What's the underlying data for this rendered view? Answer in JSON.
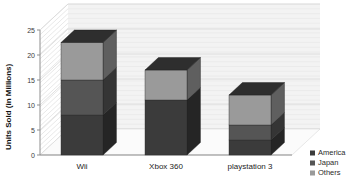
{
  "chart_data": {
    "type": "bar",
    "stacked": true,
    "three_d": true,
    "title": "",
    "xlabel": "",
    "ylabel": "Units Sold (in Millions)",
    "ylim": [
      0,
      25
    ],
    "yticks": [
      0,
      5,
      10,
      15,
      20,
      25
    ],
    "ytick_labels": [
      "0",
      "5",
      "10",
      "15",
      "20",
      "25"
    ],
    "grid": true,
    "categories": [
      "Wii",
      "Xbox 360",
      "playstation 3"
    ],
    "series": [
      {
        "name": "America",
        "color": "#3b3b3b",
        "values": [
          8.0,
          11.0,
          3.0
        ]
      },
      {
        "name": "Japan",
        "color": "#555555",
        "values": [
          7.0,
          0.0,
          3.0
        ]
      },
      {
        "name": "Others",
        "color": "#9a9a9a",
        "values": [
          7.5,
          6.0,
          6.0
        ]
      }
    ],
    "totals": [
      22.5,
      17.0,
      12.0
    ],
    "legend_position": "bottom-right",
    "legend_entries": [
      {
        "label": "America",
        "color": "#3b3b3b"
      },
      {
        "label": "Japan",
        "color": "#555555"
      },
      {
        "label": "Others",
        "color": "#9a9a9a"
      }
    ]
  },
  "colors": {
    "america": "#3b3b3b",
    "japan": "#555555",
    "others": "#9a9a9a",
    "side_america": "#262626",
    "side_japan": "#3a3a3a",
    "side_others": "#6b6b6b",
    "top_face": "#2f2f2f",
    "axis": "#8d8d8d",
    "grid": "#d8d8d8",
    "wall": "#f3f3f3",
    "floor": "#fbfbfb",
    "text": "#222222"
  }
}
